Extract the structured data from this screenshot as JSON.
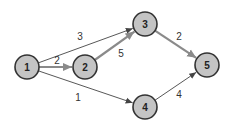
{
  "diagram": {
    "type": "directed-weighted-graph",
    "colors": {
      "node_fill": "#c4c4c4",
      "node_stroke": "#333333",
      "thick_edge": "#8a8a8a",
      "thin_edge": "#444444",
      "background": "#ffffff"
    },
    "nodes": [
      {
        "id": "1",
        "label": "1",
        "x": 27,
        "y": 67
      },
      {
        "id": "2",
        "label": "2",
        "x": 85,
        "y": 67
      },
      {
        "id": "3",
        "label": "3",
        "x": 145,
        "y": 24
      },
      {
        "id": "4",
        "label": "4",
        "x": 145,
        "y": 107
      },
      {
        "id": "5",
        "label": "5",
        "x": 207,
        "y": 65
      }
    ],
    "edges": [
      {
        "from": "1",
        "to": "3",
        "weight": "3",
        "style": "thin",
        "lx": 80,
        "ly": 40
      },
      {
        "from": "1",
        "to": "2",
        "weight": "2",
        "style": "thick",
        "lx": 57,
        "ly": 64
      },
      {
        "from": "2",
        "to": "3",
        "weight": "5",
        "style": "thick",
        "lx": 121,
        "ly": 57
      },
      {
        "from": "1",
        "to": "4",
        "weight": "1",
        "style": "thin",
        "lx": 78,
        "ly": 101
      },
      {
        "from": "3",
        "to": "5",
        "weight": "2",
        "style": "thick",
        "lx": 179,
        "ly": 40
      },
      {
        "from": "4",
        "to": "5",
        "weight": "4",
        "style": "thin",
        "lx": 179,
        "ly": 98
      }
    ]
  }
}
